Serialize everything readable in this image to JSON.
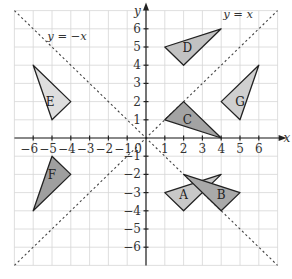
{
  "diagram": {
    "title": "",
    "axes": {
      "x_label": "x",
      "y_label": "y",
      "origin_label": "0",
      "x_range": [
        -7,
        7
      ],
      "y_range": [
        -7,
        7
      ],
      "x_ticks": [
        -6,
        -5,
        -4,
        -3,
        -2,
        -1,
        1,
        2,
        3,
        4,
        5,
        6
      ],
      "y_ticks": [
        -6,
        -5,
        -4,
        -3,
        -2,
        -1,
        1,
        2,
        3,
        4,
        5,
        6
      ],
      "grid": true
    },
    "lines": [
      {
        "id": "y_eq_x",
        "label": "y = x",
        "slope": 1,
        "style": "dotted"
      },
      {
        "id": "y_eq_neg_x",
        "label": "y = −x",
        "slope": -1,
        "style": "dotted"
      }
    ],
    "triangles": [
      {
        "label": "A",
        "vertices": [
          [
            1,
            -3
          ],
          [
            4,
            -2
          ],
          [
            2,
            -4
          ]
        ],
        "fill": "#c8c8c8"
      },
      {
        "label": "B",
        "vertices": [
          [
            2,
            -2
          ],
          [
            5,
            -3
          ],
          [
            4,
            -4
          ]
        ],
        "fill": "#a9a9a9"
      },
      {
        "label": "C",
        "vertices": [
          [
            1,
            1
          ],
          [
            2,
            2
          ],
          [
            4,
            0
          ]
        ],
        "fill": "#a3a3a3"
      },
      {
        "label": "D",
        "vertices": [
          [
            1,
            5
          ],
          [
            4,
            6
          ],
          [
            2,
            4
          ]
        ],
        "fill": "#c2c2c2"
      },
      {
        "label": "E",
        "vertices": [
          [
            -6,
            4
          ],
          [
            -4,
            2
          ],
          [
            -5,
            1
          ]
        ],
        "fill": "#dedede"
      },
      {
        "label": "F",
        "vertices": [
          [
            -5,
            -1
          ],
          [
            -4,
            -2
          ],
          [
            -6,
            -4
          ]
        ],
        "fill": "#9f9f9f"
      },
      {
        "label": "G",
        "vertices": [
          [
            4,
            2
          ],
          [
            6,
            4
          ],
          [
            5,
            1
          ]
        ],
        "fill": "#cfcfcf"
      }
    ],
    "label_positions": {
      "A": [
        2,
        -3.1
      ],
      "B": [
        4,
        -3.1
      ],
      "C": [
        2.2,
        1.0
      ],
      "D": [
        2.2,
        5.0
      ],
      "E": [
        -5.1,
        2.0
      ],
      "F": [
        -5.0,
        -2.0
      ],
      "G": [
        5.0,
        2.0
      ]
    },
    "line_label_positions": {
      "y_eq_x": [
        4.9,
        6.6
      ],
      "y_eq_neg_x": [
        -4.2,
        5.4
      ]
    }
  }
}
